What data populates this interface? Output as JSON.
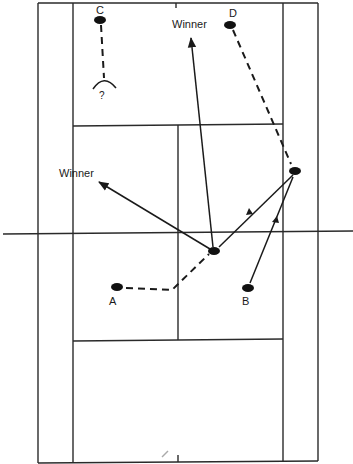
{
  "diagram": {
    "type": "tennis-doubles-court-tactics",
    "colors": {
      "ink": "#1a1a1a",
      "background": "#ffffff"
    },
    "labels": {
      "winner_top": "Winner",
      "winner_left": "Winner",
      "player_a": "A",
      "player_b": "B",
      "player_c": "C",
      "player_d": "D",
      "question": "?"
    },
    "players": [
      {
        "id": "C",
        "x": 100,
        "y": 19
      },
      {
        "id": "D",
        "x": 230,
        "y": 25
      },
      {
        "id": "A",
        "x": 117,
        "y": 287
      },
      {
        "id": "B",
        "x": 248,
        "y": 288
      },
      {
        "id": "net-player",
        "x": 214,
        "y": 251
      },
      {
        "id": "right-player",
        "x": 295,
        "y": 171
      }
    ],
    "shots": [
      {
        "type": "movement-dashed",
        "from": "C",
        "to": "?"
      },
      {
        "type": "movement-dashed",
        "from": "D",
        "to": "right-player"
      },
      {
        "type": "movement-dashed",
        "from": "A",
        "to": "net-player"
      },
      {
        "type": "shot-solid",
        "from": "B",
        "to": "right-player"
      },
      {
        "type": "shot-solid",
        "from": "right-player",
        "to": "net-player"
      },
      {
        "type": "shot-solid",
        "from": "net-player",
        "to": "Winner (top)"
      },
      {
        "type": "shot-solid",
        "from": "net-player",
        "to": "Winner (left)"
      }
    ]
  }
}
